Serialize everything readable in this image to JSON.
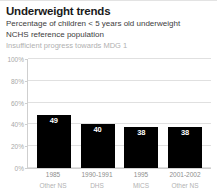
{
  "header": {
    "title": "Underweight trends",
    "subtitle_line1": "Percentage of children < 5 years old underweight",
    "subtitle_line2": "NCHS reference population",
    "status": "Insufficient progress towards MDG 1"
  },
  "colors": {
    "bar": "#000000",
    "grid": "#e0e0e0",
    "axis": "#cfcfcf",
    "value_label": "#ffffff",
    "tick_label": "#a8a8a8",
    "status_text": "#b0b0b0"
  },
  "chart_data": {
    "type": "bar",
    "title": "Underweight trends",
    "subtitle": "Percentage of children < 5 years old underweight NCHS reference population",
    "xlabel": "",
    "ylabel": "",
    "ylim": [
      0,
      100
    ],
    "yticks": [
      0,
      20,
      40,
      60,
      80,
      100
    ],
    "ytick_labels": [
      "0%",
      "20%",
      "40%",
      "60%",
      "80%",
      "100%"
    ],
    "grid": true,
    "legend": "none",
    "categories": [
      "1985",
      "1990-1991",
      "1995",
      "2001-2002"
    ],
    "category_sources": [
      "Other NS",
      "DHS",
      "MICS",
      "Other NS"
    ],
    "values": [
      49,
      40,
      38,
      38
    ],
    "value_labels": [
      "49",
      "40",
      "38",
      "38"
    ],
    "annotation": "Insufficient progress towards MDG 1"
  }
}
